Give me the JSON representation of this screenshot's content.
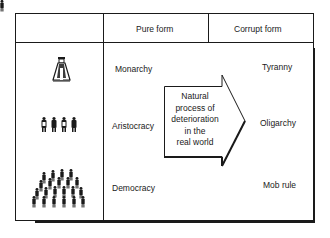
{
  "table": {
    "headers": [
      "",
      "Pure form",
      "Corrupt form"
    ],
    "rows": [
      {
        "icon": "monarch-figure-icon",
        "pure": "Monarchy",
        "corrupt": "Tyranny"
      },
      {
        "icon": "four-people-icon",
        "pure": "Aristocracy",
        "corrupt": "Oligarchy"
      },
      {
        "icon": "crowd-icon",
        "pure": "Democracy",
        "corrupt": "Mob rule"
      }
    ]
  },
  "arrow": {
    "lines": [
      "Natural",
      "process of",
      "deterioration",
      "in the",
      "real world"
    ]
  },
  "colors": {
    "line": "#1a1a1a",
    "background": "#ffffff"
  }
}
